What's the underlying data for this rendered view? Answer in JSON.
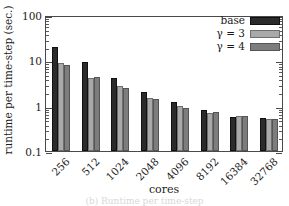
{
  "chart_data": {
    "type": "bar",
    "title": "",
    "xlabel": "cores",
    "ylabel": "runtime per time-step (sec.)",
    "categories": [
      "256",
      "512",
      "1024",
      "2048",
      "4096",
      "8192",
      "16384",
      "32768"
    ],
    "series": [
      {
        "name": "base",
        "color": "#2b2b2b",
        "values": [
          20.0,
          9.4,
          4.0,
          2.05,
          1.2,
          0.81,
          0.57,
          0.53
        ]
      },
      {
        "name": "γ = 3",
        "color": "#a9a9a9",
        "values": [
          8.7,
          4.1,
          2.65,
          1.45,
          0.98,
          0.68,
          0.58,
          0.5
        ]
      },
      {
        "name": "γ = 4",
        "color": "#7d7d7d",
        "values": [
          7.8,
          4.3,
          2.5,
          1.42,
          0.88,
          0.72,
          0.6,
          0.5
        ]
      }
    ],
    "yscale": "log",
    "ylim": [
      0.1,
      100
    ],
    "ytick_labels": [
      "0.1",
      "1",
      "10",
      "100"
    ],
    "ytick_values": [
      0.1,
      1,
      10,
      100
    ],
    "grid": false,
    "legend_position": "top-right"
  },
  "legend": {
    "entries": [
      {
        "label": "base"
      },
      {
        "label": "γ = 3"
      },
      {
        "label": "γ = 4"
      }
    ]
  },
  "caption": "(b) Runtime per time-step"
}
